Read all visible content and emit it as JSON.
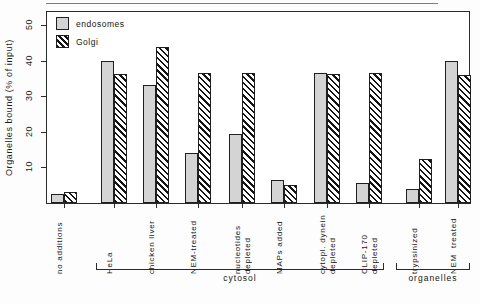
{
  "chart_data": {
    "type": "bar",
    "title": "",
    "xlabel": "",
    "ylabel": "Organelles bound (% of input)",
    "ylim": [
      0,
      54
    ],
    "yticks": [
      10,
      20,
      30,
      40,
      50
    ],
    "grid": false,
    "legend_position": "top-left",
    "categories": [
      "no additions",
      "HeLa",
      "chicken liver",
      "NEM-treated",
      "nucleotides depleted",
      "MAPs added",
      "cytopl. dynein depleted",
      "CLIP-170 depleted",
      "trypsinized",
      "NEM treated"
    ],
    "series": [
      {
        "name": "endosomes",
        "values": [
          2.5,
          40.0,
          33.3,
          14.0,
          19.3,
          6.5,
          36.5,
          5.5,
          4.0,
          40.0
        ]
      },
      {
        "name": "Golgi",
        "values": [
          3.0,
          36.2,
          43.8,
          36.5,
          36.5,
          5.0,
          36.3,
          36.5,
          12.5,
          36.0
        ]
      }
    ],
    "groups": [
      {
        "label": "cytosol",
        "categories": [
          "HeLa",
          "chicken liver",
          "NEM-treated",
          "nucleotides depleted",
          "MAPs added",
          "cytopl. dynein depleted",
          "CLIP-170 depleted"
        ]
      },
      {
        "label": "organelles",
        "categories": [
          "trypsinized",
          "NEM treated"
        ]
      }
    ]
  },
  "legend": {
    "items": [
      {
        "label": "endosomes",
        "swatch": "solid-light-gray"
      },
      {
        "label": "Golgi",
        "swatch": "diagonal-hatch"
      }
    ]
  },
  "axis": {
    "y_title": "Organelles bound (% of input)",
    "y_tick_labels": [
      "10",
      "20",
      "30",
      "40",
      "50"
    ]
  },
  "category_labels": [
    "no additions",
    "HeLa",
    "chicken liver",
    "NEM-treated",
    "nucleotides\ndepleted",
    "MAPs added",
    "cytopl. dynein\ndepleted",
    "CLIP-170\ndepleted",
    "trypsinized",
    "NEM  treated"
  ],
  "group_labels": [
    "cytosol",
    "organelles"
  ],
  "colors": {
    "endosomes_fill": "#d4d4d4",
    "golgi_hatch": "#141414",
    "axis": "#2b2b2b",
    "text": "#141414",
    "background": "#fdfdfd"
  }
}
